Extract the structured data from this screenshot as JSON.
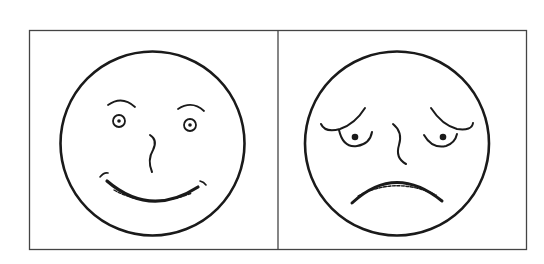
{
  "figure": {
    "panels": [
      {
        "id": "happy",
        "expression": "happy-face"
      },
      {
        "id": "sad",
        "expression": "sad-face"
      }
    ],
    "colors": {
      "line": "#1a1a1a",
      "frame": "#444444",
      "background": "#ffffff"
    }
  }
}
